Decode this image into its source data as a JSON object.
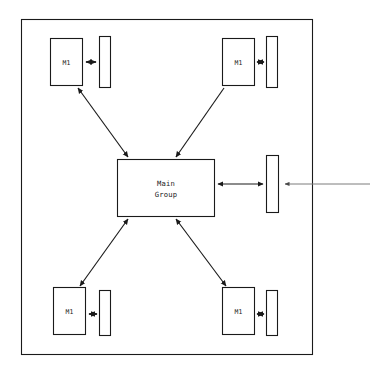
{
  "diagram": {
    "background_color": "#ffffff",
    "stroke_color": "#1a1a1a",
    "external_stroke_color": "#7d7d7d",
    "frame": {
      "name": "outer-boundary",
      "x": 21,
      "y": 19,
      "width": 292,
      "height": 336
    },
    "center": {
      "label_line1": "Main",
      "label_line2": "Group",
      "x": 117,
      "y": 159,
      "width": 98,
      "height": 58
    },
    "modules": [
      {
        "id": "module-top-left",
        "label": "M1",
        "x": 50,
        "y": 38,
        "width": 33,
        "height": 48,
        "bar": {
          "x": 99,
          "y": 36,
          "width": 12,
          "height": 52
        },
        "connector_arrows": "both"
      },
      {
        "id": "module-top-right",
        "label": "M1",
        "x": 222,
        "y": 38,
        "width": 33,
        "height": 48,
        "bar": {
          "x": 266,
          "y": 36,
          "width": 12,
          "height": 52
        },
        "connector_arrows": "both"
      },
      {
        "id": "module-bottom-left",
        "label": "M1",
        "x": 53,
        "y": 287,
        "width": 33,
        "height": 48,
        "bar": {
          "x": 99,
          "y": 290,
          "width": 12,
          "height": 46
        },
        "connector_arrows": "both"
      },
      {
        "id": "module-bottom-right",
        "label": "M1",
        "x": 222,
        "y": 287,
        "width": 33,
        "height": 48,
        "bar": {
          "x": 266,
          "y": 290,
          "width": 12,
          "height": 46
        },
        "connector_arrows": "both"
      }
    ],
    "side_bar": {
      "id": "interface-bar-right",
      "x": 266,
      "y": 155,
      "width": 13,
      "height": 58
    },
    "links": [
      {
        "id": "link-top-left",
        "from": "module-top-left",
        "to": "center",
        "arrows": "both"
      },
      {
        "id": "link-top-right",
        "from": "module-top-right",
        "to": "center",
        "arrows": "end"
      },
      {
        "id": "link-bottom-left",
        "from": "center",
        "to": "module-bottom-left",
        "arrows": "both"
      },
      {
        "id": "link-bottom-right",
        "from": "center",
        "to": "module-bottom-right",
        "arrows": "both"
      },
      {
        "id": "link-center-sidebar",
        "from": "center",
        "to": "interface-bar-right",
        "arrows": "both"
      },
      {
        "id": "link-external-input",
        "from": "external",
        "to": "interface-bar-right",
        "arrows": "end"
      }
    ],
    "external_line": {
      "id": "external-input-line",
      "x_start": 370,
      "x_end": 283,
      "y": 184
    }
  }
}
